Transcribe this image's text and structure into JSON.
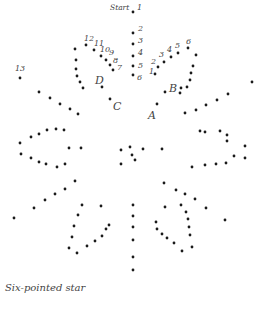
{
  "title": "Six-pointed star",
  "start_label": "Start",
  "numbered_dots": [
    {
      "label": "1",
      "x": 133,
      "y": 12,
      "lx": 137,
      "ly": 10
    },
    {
      "label": "2",
      "x": 133,
      "y": 33,
      "lx": 138,
      "ly": 31
    },
    {
      "label": "3",
      "x": 133,
      "y": 44,
      "lx": 138,
      "ly": 43
    },
    {
      "label": "4",
      "x": 133,
      "y": 56,
      "lx": 138,
      "ly": 55
    },
    {
      "label": "5",
      "x": 133,
      "y": 66,
      "lx": 138,
      "ly": 68
    },
    {
      "label": "6",
      "x": 133,
      "y": 75,
      "lx": 137,
      "ly": 80
    },
    {
      "label": "1",
      "x": 155,
      "y": 74,
      "lx": 149,
      "ly": 74
    },
    {
      "label": "2",
      "x": 158,
      "y": 67,
      "lx": 151,
      "ly": 64
    },
    {
      "label": "3",
      "x": 164,
      "y": 62,
      "lx": 159,
      "ly": 57
    },
    {
      "label": "4",
      "x": 171,
      "y": 57,
      "lx": 167,
      "ly": 52
    },
    {
      "label": "5",
      "x": 178,
      "y": 53,
      "lx": 175,
      "ly": 48
    },
    {
      "label": "6",
      "x": 188,
      "y": 48,
      "lx": 186,
      "ly": 44
    },
    {
      "label": "7",
      "x": 113,
      "y": 70,
      "lx": 117,
      "ly": 70
    },
    {
      "label": "8",
      "x": 110,
      "y": 65,
      "lx": 113,
      "ly": 63
    },
    {
      "label": "9",
      "x": 106,
      "y": 60,
      "lx": 109,
      "ly": 55
    },
    {
      "label": "10",
      "x": 101,
      "y": 56,
      "lx": 100,
      "ly": 52
    },
    {
      "label": "11",
      "x": 94,
      "y": 50,
      "lx": 94,
      "ly": 46
    },
    {
      "label": "12",
      "x": 86,
      "y": 45,
      "lx": 84,
      "ly": 41
    },
    {
      "label": "13",
      "x": 20,
      "y": 78,
      "lx": 15,
      "ly": 71
    }
  ],
  "lettered_points": [
    {
      "label": "A",
      "x": 157,
      "y": 104,
      "lx": 148,
      "ly": 119
    },
    {
      "label": "B",
      "x": 165,
      "y": 92,
      "lx": 169,
      "ly": 92
    },
    {
      "label": "C",
      "x": 110,
      "y": 99,
      "lx": 113,
      "ly": 110
    },
    {
      "label": "D",
      "x": 102,
      "y": 87,
      "lx": 95,
      "ly": 84
    }
  ],
  "plain_dots": [
    [
      196,
      55
    ],
    [
      193,
      66
    ],
    [
      191,
      73
    ],
    [
      190,
      80
    ],
    [
      187,
      87
    ],
    [
      180,
      93
    ],
    [
      181,
      88
    ],
    [
      75,
      49
    ],
    [
      76,
      60
    ],
    [
      76,
      69
    ],
    [
      77,
      76
    ],
    [
      80,
      82
    ],
    [
      83,
      88
    ],
    [
      39,
      92
    ],
    [
      50,
      98
    ],
    [
      60,
      104
    ],
    [
      70,
      109
    ],
    [
      78,
      114
    ],
    [
      252,
      82
    ],
    [
      228,
      94
    ],
    [
      217,
      100
    ],
    [
      206,
      105
    ],
    [
      196,
      110
    ],
    [
      185,
      113
    ],
    [
      20,
      143
    ],
    [
      21,
      154
    ],
    [
      31,
      137
    ],
    [
      31,
      158
    ],
    [
      39,
      134
    ],
    [
      39,
      162
    ],
    [
      47,
      130
    ],
    [
      46,
      164
    ],
    [
      56,
      129
    ],
    [
      57,
      167
    ],
    [
      64,
      130
    ],
    [
      65,
      164
    ],
    [
      69,
      148
    ],
    [
      81,
      148
    ],
    [
      121,
      150
    ],
    [
      130,
      147
    ],
    [
      132,
      155
    ],
    [
      121,
      164
    ],
    [
      135,
      160
    ],
    [
      143,
      149
    ],
    [
      162,
      149
    ],
    [
      200,
      131
    ],
    [
      205,
      132
    ],
    [
      220,
      131
    ],
    [
      227,
      135
    ],
    [
      227,
      141
    ],
    [
      245,
      146
    ],
    [
      245,
      158
    ],
    [
      234,
      156
    ],
    [
      226,
      163
    ],
    [
      216,
      164
    ],
    [
      205,
      165
    ],
    [
      192,
      167
    ],
    [
      75,
      181
    ],
    [
      65,
      189
    ],
    [
      55,
      194
    ],
    [
      45,
      200
    ],
    [
      34,
      208
    ],
    [
      14,
      218
    ],
    [
      164,
      183
    ],
    [
      176,
      190
    ],
    [
      185,
      194
    ],
    [
      195,
      199
    ],
    [
      206,
      208
    ],
    [
      225,
      220
    ],
    [
      82,
      205
    ],
    [
      78,
      215
    ],
    [
      74,
      226
    ],
    [
      72,
      237
    ],
    [
      69,
      248
    ],
    [
      77,
      253
    ],
    [
      87,
      246
    ],
    [
      95,
      241
    ],
    [
      102,
      236
    ],
    [
      109,
      225
    ],
    [
      106,
      229
    ],
    [
      101,
      206
    ],
    [
      165,
      207
    ],
    [
      181,
      205
    ],
    [
      186,
      212
    ],
    [
      188,
      219
    ],
    [
      189,
      227
    ],
    [
      190,
      235
    ],
    [
      192,
      247
    ],
    [
      182,
      251
    ],
    [
      174,
      243
    ],
    [
      167,
      238
    ],
    [
      162,
      234
    ],
    [
      157,
      229
    ],
    [
      156,
      222
    ],
    [
      133,
      205
    ],
    [
      133,
      216
    ],
    [
      133,
      227
    ],
    [
      133,
      240
    ],
    [
      133,
      257
    ],
    [
      133,
      270
    ]
  ]
}
